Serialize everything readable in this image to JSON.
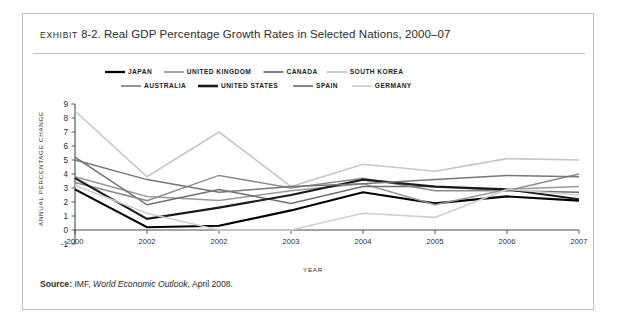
{
  "exhibit": {
    "label": "EXHIBIT",
    "number": "8-2.",
    "title": "Real GDP Percentage Growth Rates in Selected Nations, 2000–07"
  },
  "source": {
    "label": "Source:",
    "prefix": "IMF,",
    "italic": "World Economic Outlook",
    "suffix": ", April 2008."
  },
  "axes": {
    "y_title": "ANNUAL PERCENTAGE CHANGE",
    "x_title": "YEAR"
  },
  "chart_data": {
    "type": "line",
    "xlabel": "YEAR",
    "ylabel": "ANNUAL PERCENTAGE CHANGE",
    "categories": [
      "2000",
      "2002",
      "2002",
      "2003",
      "2004",
      "2005",
      "2006",
      "2007"
    ],
    "x_tick_labels": [
      "2000",
      "2002",
      "2002",
      "2003",
      "2004",
      "2005",
      "2006",
      "2007"
    ],
    "y_tick_labels": [
      "9",
      "8",
      "7",
      "6",
      "5",
      "4",
      "3",
      "2",
      "1",
      "0",
      "-1"
    ],
    "ylim": [
      -1,
      9
    ],
    "y_ticks": [
      -1,
      0,
      1,
      2,
      3,
      4,
      5,
      6,
      7,
      8,
      9
    ],
    "grid": false,
    "legend_position": "top",
    "series": [
      {
        "name": "JAPAN",
        "color": "#000000",
        "width": 2.1,
        "values": [
          2.9,
          0.2,
          0.3,
          1.4,
          2.7,
          1.9,
          2.4,
          2.1
        ]
      },
      {
        "name": "UNITED KINGDOM",
        "color": "#9a9a9a",
        "width": 1.5,
        "values": [
          3.8,
          2.4,
          2.1,
          2.8,
          3.3,
          1.8,
          2.9,
          3.1
        ]
      },
      {
        "name": "CANADA",
        "color": "#6e6e6e",
        "width": 1.5,
        "values": [
          5.2,
          1.8,
          2.9,
          1.9,
          3.1,
          3.1,
          2.8,
          2.7
        ]
      },
      {
        "name": "SOUTH KOREA",
        "color": "#c6c6c6",
        "width": 1.6,
        "values": [
          8.5,
          3.8,
          7.0,
          3.1,
          4.7,
          4.2,
          5.1,
          5.0
        ]
      },
      {
        "name": "AUSTRALIA",
        "color": "#8c8c8c",
        "width": 1.5,
        "values": [
          3.4,
          2.1,
          3.9,
          3.0,
          3.7,
          2.8,
          2.8,
          4.0
        ]
      },
      {
        "name": "UNITED STATES",
        "color": "#1a1a1a",
        "width": 2.1,
        "values": [
          3.7,
          0.8,
          1.6,
          2.5,
          3.6,
          3.1,
          2.9,
          2.2
        ]
      },
      {
        "name": "SPAIN",
        "color": "#767676",
        "width": 1.5,
        "values": [
          5.0,
          3.6,
          2.7,
          3.1,
          3.3,
          3.6,
          3.9,
          3.8
        ]
      },
      {
        "name": "GERMANY",
        "color": "#cfcfcf",
        "width": 1.6,
        "values": [
          3.2,
          1.2,
          0.0,
          0.0,
          1.2,
          0.9,
          2.9,
          2.5
        ]
      }
    ]
  },
  "legend": {
    "rows": [
      [
        {
          "name": "JAPAN",
          "color": "#000000",
          "width": 2.3
        },
        {
          "name": "UNITED KINGDOM",
          "color": "#9a9a9a",
          "width": 1.8
        },
        {
          "name": "CANADA",
          "color": "#6e6e6e",
          "width": 1.8
        },
        {
          "name": "SOUTH KOREA",
          "color": "#c6c6c6",
          "width": 1.8
        }
      ],
      [
        {
          "name": "AUSTRALIA",
          "color": "#8c8c8c",
          "width": 1.8
        },
        {
          "name": "UNITED STATES",
          "color": "#1a1a1a",
          "width": 2.6
        },
        {
          "name": "SPAIN",
          "color": "#767676",
          "width": 1.8
        },
        {
          "name": "GERMANY",
          "color": "#cfcfcf",
          "width": 1.8
        }
      ]
    ]
  }
}
